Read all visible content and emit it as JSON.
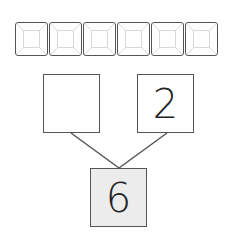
{
  "base_ten_blocks": {
    "count": 6,
    "items": [
      {
        "label": ""
      },
      {
        "label": ""
      },
      {
        "label": ""
      },
      {
        "label": ""
      },
      {
        "label": ""
      },
      {
        "label": ""
      }
    ]
  },
  "number_bond": {
    "left_part": "",
    "right_part": "2",
    "whole": "6"
  },
  "colors": {
    "border": "#555555",
    "whole_fill": "#ececec",
    "block_inner": "#d8d8d8"
  }
}
